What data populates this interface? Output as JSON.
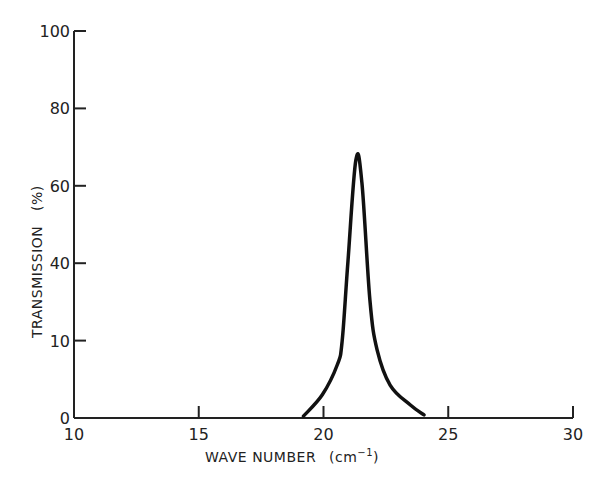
{
  "chart_data": {
    "type": "line",
    "title": "",
    "xlabel": "WAVE NUMBER (cm⁻¹)",
    "ylabel": "TRANSMISSION (%)",
    "xlim": [
      10,
      30
    ],
    "ylim": [
      0,
      100
    ],
    "grid": false,
    "legend": null,
    "x_ticks": [
      10,
      15,
      20,
      25,
      30
    ],
    "x_tick_labels": [
      "10",
      "15",
      "20",
      "25",
      "30"
    ],
    "y_ticks": [
      0,
      20,
      40,
      60,
      80,
      100
    ],
    "y_tick_labels": [
      "0",
      "10",
      "40",
      "60",
      "80",
      "100"
    ],
    "series": [
      {
        "name": "transmission",
        "x": [
          19.2,
          19.95,
          20.55,
          20.75,
          20.98,
          21.3,
          21.54,
          21.86,
          22.15,
          22.67,
          23.47,
          24.03
        ],
        "y": [
          0.5,
          6,
          13.7,
          20,
          40.6,
          66.7,
          60.8,
          30.5,
          17.6,
          8.5,
          3.4,
          0.8
        ]
      }
    ],
    "annotations": [
      {
        "type": "small-vertical-tick",
        "x": 20,
        "note": "tick mark at x=20 extends inside curve base"
      }
    ]
  },
  "axes": {
    "xlabel_main": "WAVE NUMBER",
    "xlabel_unit_open": "(cm",
    "xlabel_unit_sup": "−1",
    "xlabel_unit_close": ")",
    "ylabel": "TRANSMISSION   (%)"
  },
  "colors": {
    "line": "#111111",
    "axis": "#222222",
    "background": "#ffffff"
  }
}
